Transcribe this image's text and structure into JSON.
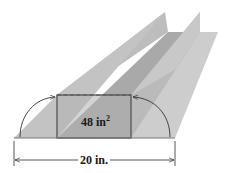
{
  "figure": {
    "type": "gutter-folding-diagram",
    "area_label": "48 in",
    "area_exponent": "2",
    "width_label": "20 in.",
    "colors": {
      "base_sheet": "#c9c9c9",
      "left_wall": "#b9b9b9",
      "right_wall": "#c2c2c2",
      "channel_floor": "#a8a8a8",
      "cross_section": "#b3b3b3",
      "outline": "#555555",
      "arrow": "#333333"
    }
  }
}
